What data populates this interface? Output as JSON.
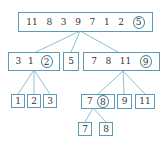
{
  "diagram": {
    "type": "quicksort-recursion-tree",
    "colors": {
      "box_border": "#5b9bb5",
      "line": "#8fbfd2",
      "pivot_circle": "#3f7f9e",
      "text": "#333333"
    },
    "nodes": [
      {
        "id": "root",
        "values": [
          "11",
          "8",
          "3",
          "9",
          "7",
          "1",
          "2"
        ],
        "pivot": "5"
      },
      {
        "id": "left",
        "values": [
          "3",
          "1"
        ],
        "pivot": "2"
      },
      {
        "id": "mid",
        "values": [
          "5"
        ],
        "pivot": null
      },
      {
        "id": "right",
        "values": [
          "7",
          "8",
          "11"
        ],
        "pivot": "9"
      },
      {
        "id": "l1",
        "values": [
          "1"
        ],
        "pivot": null
      },
      {
        "id": "l2",
        "values": [
          "2"
        ],
        "pivot": null
      },
      {
        "id": "l3",
        "values": [
          "3"
        ],
        "pivot": null
      },
      {
        "id": "r1",
        "values": [
          "7"
        ],
        "pivot": "8"
      },
      {
        "id": "r2",
        "values": [
          "9"
        ],
        "pivot": null
      },
      {
        "id": "r3",
        "values": [
          "11"
        ],
        "pivot": null
      },
      {
        "id": "rr1",
        "values": [
          "7"
        ],
        "pivot": null
      },
      {
        "id": "rr2",
        "values": [
          "8"
        ],
        "pivot": null
      }
    ],
    "edges": [
      [
        "root",
        "left"
      ],
      [
        "root",
        "mid"
      ],
      [
        "root",
        "right"
      ],
      [
        "left",
        "l1"
      ],
      [
        "left",
        "l2"
      ],
      [
        "left",
        "l3"
      ],
      [
        "right",
        "r1"
      ],
      [
        "right",
        "r2"
      ],
      [
        "right",
        "r3"
      ],
      [
        "r1",
        "rr1"
      ],
      [
        "r1",
        "rr2"
      ]
    ]
  }
}
